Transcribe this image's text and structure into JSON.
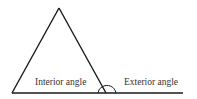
{
  "diagram": {
    "title": "",
    "labels": {
      "interior": "Interior angle",
      "exterior": "Exterior angle"
    },
    "colors": {
      "stroke": "#1a1a1a",
      "text": "#333333",
      "background": "#ffffff"
    },
    "shapes": {
      "triangle": {
        "apex": [
          59,
          8
        ],
        "base_left": [
          12,
          93
        ],
        "base_right": [
          106,
          93
        ]
      },
      "extended_line": {
        "from": [
          12,
          93
        ],
        "to": [
          183,
          93
        ]
      }
    }
  }
}
